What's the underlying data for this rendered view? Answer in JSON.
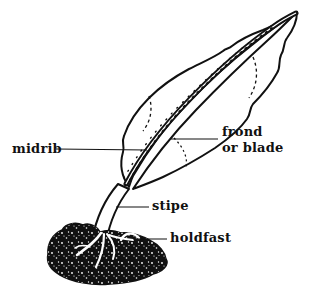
{
  "figure": {
    "background": "#ffffff",
    "ink": "#111111",
    "labels": {
      "midrib": "midrib",
      "frond_line1": "frond",
      "frond_line2": "or blade",
      "stipe": "stipe",
      "holdfast": "holdfast"
    }
  }
}
